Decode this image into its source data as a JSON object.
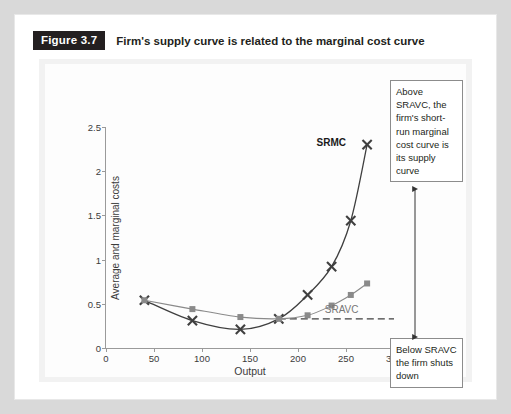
{
  "caption": {
    "figure_tag": "Figure 3.7",
    "text": "Firm's supply curve is related to the marginal cost curve"
  },
  "annotations": {
    "above": "Above SRAVC, the firm's short-run marginal cost curve is its supply curve",
    "below": "Below SRAVC the firm shuts down"
  },
  "colors": {
    "srmc": "#3f3f3f",
    "sravc": "#8a8a8a",
    "axis": "#9a9a9a",
    "tag_bg": "#231f20",
    "frame_bg": "#f2f2f2",
    "text": "#231f20"
  },
  "chart_data": {
    "type": "line",
    "title": "Firm's supply curve is related to the marginal cost curve",
    "xlabel": "Output",
    "ylabel": "Average and marginal costs",
    "xlim": [
      0,
      300
    ],
    "ylim": [
      0,
      2.5
    ],
    "xticks": [
      0,
      50,
      100,
      150,
      200,
      250,
      300
    ],
    "yticks": [
      0,
      0.5,
      1,
      1.5,
      2,
      2.5
    ],
    "grid": false,
    "legend": "inline-curve-labels",
    "series": [
      {
        "name": "SRMC",
        "label": "SRMC",
        "marker": "x",
        "color": "#3f3f3f",
        "x": [
          40,
          90,
          140,
          180,
          210,
          235,
          255,
          272
        ],
        "y": [
          0.54,
          0.31,
          0.21,
          0.33,
          0.6,
          0.92,
          1.44,
          2.3
        ]
      },
      {
        "name": "SRAVC",
        "label": "SRAVC",
        "marker": "square",
        "color": "#8a8a8a",
        "x": [
          40,
          90,
          140,
          180,
          210,
          235,
          255,
          272
        ],
        "y": [
          0.54,
          0.44,
          0.35,
          0.33,
          0.37,
          0.48,
          0.6,
          0.73
        ]
      }
    ],
    "annotations": [
      {
        "type": "hline",
        "y": 0.33,
        "x_from": 180,
        "x_to": 300,
        "style": "dashed",
        "color": "#3f3f3f"
      },
      {
        "type": "text",
        "text": "SRMC",
        "x": 250,
        "y": 2.33,
        "bold": true
      },
      {
        "type": "text",
        "text": "SRAVC",
        "x": 263,
        "y": 0.44,
        "bold": false
      }
    ]
  }
}
